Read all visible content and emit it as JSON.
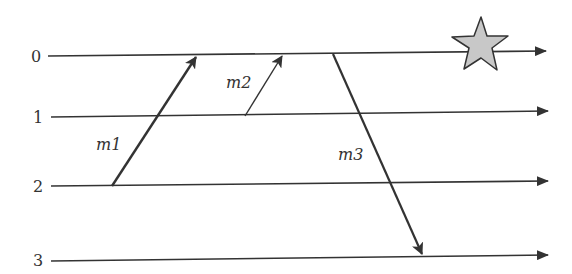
{
  "diagram": {
    "type": "space-time message diagram",
    "processes": [
      {
        "label": "0",
        "y": 56
      },
      {
        "label": "1",
        "y": 117
      },
      {
        "label": "2",
        "y": 186
      },
      {
        "label": "3",
        "y": 259
      }
    ],
    "messages": [
      {
        "label": "m1",
        "from_process": "2",
        "to_process": "0",
        "x1": 112,
        "y1": 186,
        "x2": 196,
        "y2": 57,
        "label_x": 96,
        "label_y": 150
      },
      {
        "label": "m2",
        "from_process": "1",
        "to_process": "0",
        "x1": 245,
        "y1": 116,
        "x2": 282,
        "y2": 56,
        "label_x": 226,
        "label_y": 88
      },
      {
        "label": "m3",
        "from_process": "0",
        "to_process": "3",
        "x1": 333,
        "y1": 54,
        "x2": 422,
        "y2": 254,
        "label_x": 336,
        "label_y": 160
      }
    ],
    "marker": {
      "shape": "star",
      "process": "0",
      "fill": "#c8c8c8",
      "stroke": "#333333"
    },
    "colors": {
      "line": "#333333"
    }
  }
}
